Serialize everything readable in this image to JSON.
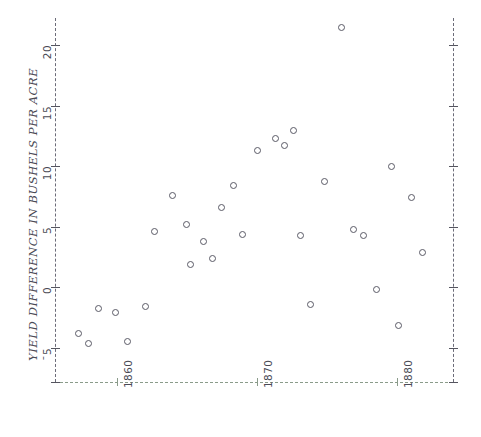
{
  "figure": {
    "background": "#ffffff",
    "width": 481,
    "height": 437,
    "marker_color": "#5a5a66",
    "axis_color": "#6b6b78",
    "baseline_color": "#8a9b8a",
    "text_color": "#4a4a55"
  },
  "chart_data": {
    "type": "scatter",
    "title": "",
    "xlabel": "",
    "ylabel": "YIELD DIFFERENCE IN BUSHELS PER ACRE",
    "xlim": [
      1855.5,
      1884.0
    ],
    "ylim": [
      -6.5,
      22.5
    ],
    "xticks": [
      1860,
      1870,
      1880
    ],
    "xticklabels": [
      "1860",
      "1870",
      "1880"
    ],
    "yticks": [
      -5,
      0,
      5,
      10,
      15,
      20
    ],
    "yticklabels": [
      "ˉ5",
      "0",
      "5",
      "10",
      "15",
      "20"
    ],
    "grid": false,
    "legend": null,
    "marker": "open-circle",
    "points": [
      {
        "x": 1857.2,
        "y": -3.8
      },
      {
        "x": 1857.9,
        "y": -4.6
      },
      {
        "x": 1858.6,
        "y": -1.7
      },
      {
        "x": 1859.8,
        "y": -2.1
      },
      {
        "x": 1860.7,
        "y": -4.5
      },
      {
        "x": 1862.0,
        "y": -1.6
      },
      {
        "x": 1862.6,
        "y": 4.6
      },
      {
        "x": 1863.9,
        "y": 7.6
      },
      {
        "x": 1864.9,
        "y": 5.2
      },
      {
        "x": 1865.2,
        "y": 1.9
      },
      {
        "x": 1866.1,
        "y": 3.8
      },
      {
        "x": 1866.8,
        "y": 2.4
      },
      {
        "x": 1867.4,
        "y": 6.6
      },
      {
        "x": 1868.3,
        "y": 8.4
      },
      {
        "x": 1868.9,
        "y": 4.4
      },
      {
        "x": 1870.0,
        "y": 11.3
      },
      {
        "x": 1871.3,
        "y": 12.3
      },
      {
        "x": 1871.9,
        "y": 11.7
      },
      {
        "x": 1872.6,
        "y": 13.0
      },
      {
        "x": 1873.1,
        "y": 4.3
      },
      {
        "x": 1873.8,
        "y": -1.4
      },
      {
        "x": 1874.8,
        "y": 8.8
      },
      {
        "x": 1876.0,
        "y": 21.5
      },
      {
        "x": 1876.9,
        "y": 4.8
      },
      {
        "x": 1877.6,
        "y": 4.3
      },
      {
        "x": 1878.5,
        "y": -0.2
      },
      {
        "x": 1879.6,
        "y": 10.0
      },
      {
        "x": 1880.1,
        "y": -3.1
      },
      {
        "x": 1881.0,
        "y": 7.4
      },
      {
        "x": 1881.8,
        "y": 2.9
      }
    ]
  }
}
